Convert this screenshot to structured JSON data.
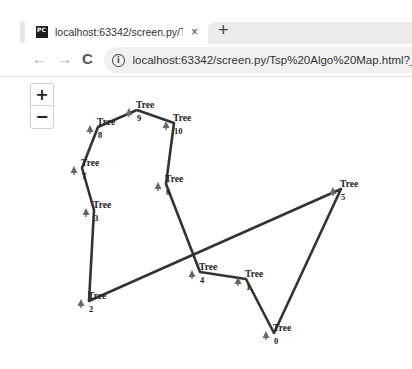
{
  "browser": {
    "tab": {
      "title": "localhost:63342/screen.py/Tsp A",
      "close_label": "×",
      "favicon": "pycharm-icon"
    },
    "new_tab_label": "+",
    "nav": {
      "back": "←",
      "forward": "→",
      "reload": "C"
    },
    "address_bar": {
      "info_glyph": "i",
      "url": "localhost:63342/screen.py/Tsp%20Algo%20Map.html?_ijt"
    }
  },
  "map": {
    "zoom_in_label": "+",
    "zoom_out_label": "−",
    "line_color": "#333333",
    "marker_color": "#666666",
    "marker_label": "Tree",
    "nodes": [
      {
        "id": "0",
        "label": "Tree",
        "x": 274,
        "y": 333
      },
      {
        "id": "1",
        "label": "Tree",
        "x": 246,
        "y": 279
      },
      {
        "id": "2",
        "label": "Tree",
        "x": 89,
        "y": 301
      },
      {
        "id": "3",
        "label": "Tree",
        "x": 94,
        "y": 210
      },
      {
        "id": "4",
        "label": "Tree",
        "x": 200,
        "y": 272
      },
      {
        "id": "5",
        "label": "Tree",
        "x": 341,
        "y": 189
      },
      {
        "id": "6",
        "label": "Tree",
        "x": 166,
        "y": 184
      },
      {
        "id": "7",
        "label": "Tree",
        "x": 82,
        "y": 168
      },
      {
        "id": "8",
        "label": "Tree",
        "x": 98,
        "y": 127
      },
      {
        "id": "9",
        "label": "Tree",
        "x": 137,
        "y": 110
      },
      {
        "id": "10",
        "label": "Tree",
        "x": 174,
        "y": 123
      }
    ],
    "route": [
      "9",
      "10",
      "6",
      "4",
      "1",
      "0",
      "5",
      "2",
      "3",
      "7",
      "8",
      "9"
    ]
  }
}
